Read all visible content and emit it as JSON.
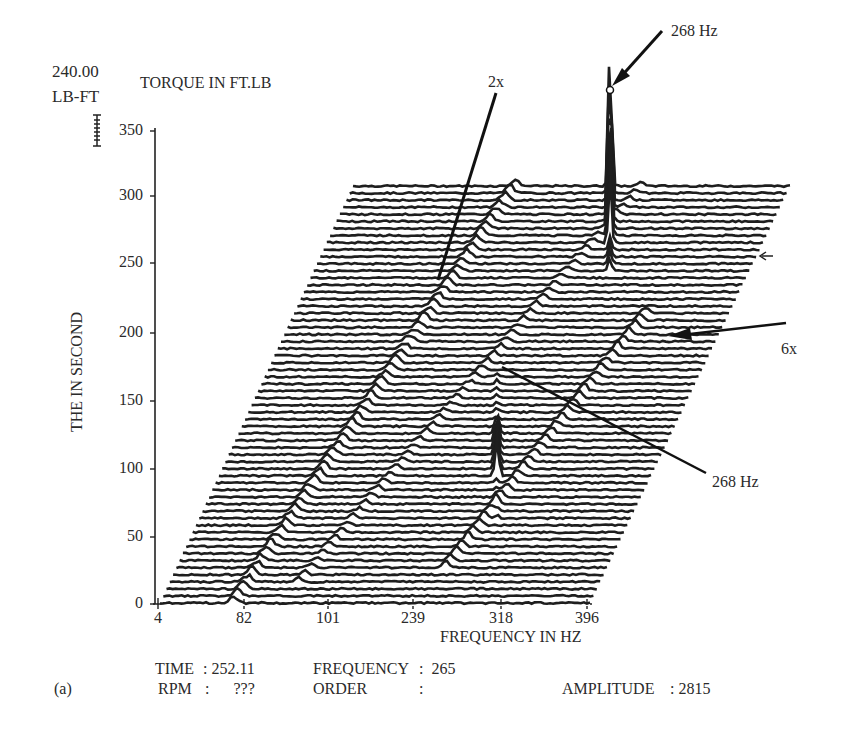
{
  "chart_data": {
    "type": "waterfall",
    "title": "TORQUE IN FT.LB",
    "amplitude_scale": {
      "value": "240.00",
      "unit": "LB-FT"
    },
    "xlabel": "FREQUENCY IN HZ",
    "ylabel": "THE IN SECOND",
    "x_tick_labels": [
      "4",
      "82",
      "101",
      "239",
      "318",
      "396"
    ],
    "y_ticks": [
      0,
      50,
      100,
      150,
      200,
      250,
      300,
      350
    ],
    "ylim": [
      0,
      350
    ],
    "time_range": [
      0,
      310
    ],
    "n_traces": 60,
    "series": [
      {
        "name": "2x order",
        "description": "ridge rising from ~80 Hz at t=0 toward ~200 Hz at t=300"
      },
      {
        "name": "4x order",
        "description": "ridge rising diagonally across mid-band"
      },
      {
        "name": "6x order",
        "description": "ridge with distinct peaks rising toward right edge near t=200"
      },
      {
        "name": "268 Hz",
        "description": "fixed-frequency resonance; strong peak around t=120-170 and dominant peak near t=250-310"
      }
    ],
    "annotations": [
      {
        "text": "268 Hz",
        "target": "tall peak at top of waterfall (circled)"
      },
      {
        "text": "2x",
        "target": "2x order ridge near t≈230"
      },
      {
        "text": "6x",
        "target": "6x order ridge near t≈200"
      },
      {
        "text": "268 Hz",
        "target": "resonance peak near t≈160"
      }
    ],
    "cursor_readout": {
      "TIME": "252.11",
      "FREQUENCY": "265",
      "RPM": "???",
      "ORDER": "",
      "AMPLITUDE": "2815"
    },
    "grid": false,
    "legend": "none"
  },
  "labels": {
    "scale_value": "240.00",
    "scale_unit": "LB-FT",
    "title": "TORQUE IN FT.LB",
    "ylabel": "THE IN SECOND",
    "xlabel": "FREQUENCY IN HZ",
    "panel": "(a)",
    "annot_top": "268 Hz",
    "annot_2x": "2x",
    "annot_6x": "6x",
    "annot_mid": "268 Hz"
  },
  "yticks": [
    "350",
    "300",
    "250",
    "200",
    "150",
    "100",
    "50",
    "0"
  ],
  "xticks": [
    "4",
    "82",
    "101",
    "239",
    "318",
    "396"
  ],
  "readout": {
    "time_label": "TIME",
    "time_value": ": 252.11",
    "rpm_label": "RPM",
    "rpm_value": ":      ???",
    "freq_label": "FREQUENCY",
    "freq_value": ":  265",
    "order_label": "ORDER",
    "order_value": ":",
    "amp_label": "AMPLITUDE",
    "amp_value": ": 2815"
  }
}
